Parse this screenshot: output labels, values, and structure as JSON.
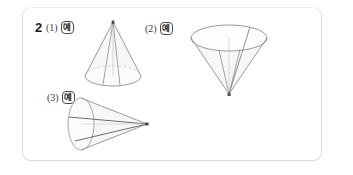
{
  "panel": {
    "background_color": "#ffffff",
    "border_color": "#dcdcdc",
    "corner_radius_px": 9
  },
  "question": {
    "number": "2",
    "items": [
      {
        "id": "1",
        "sub_label": "(1)",
        "answer_badge": "예",
        "figure": {
          "name": "cone-upright",
          "description": "원뿔 - 꼭짓점이 위",
          "orientation": "apex-up",
          "stroke_color": "#8a8a8a",
          "fill_color": "#f6f6f6"
        }
      },
      {
        "id": "2",
        "sub_label": "(2)",
        "answer_badge": "예",
        "figure": {
          "name": "cone-inverted",
          "description": "원뿔 - 꼭짓점이 아래",
          "orientation": "apex-down",
          "stroke_color": "#8a8a8a",
          "fill_color": "#f6f6f6"
        }
      },
      {
        "id": "3",
        "sub_label": "(3)",
        "answer_badge": "예",
        "figure": {
          "name": "cone-sideways",
          "description": "원뿔 - 꼭짓점이 오른쪽",
          "orientation": "apex-right",
          "stroke_color": "#8a8a8a",
          "fill_color": "#f6f6f6"
        }
      }
    ]
  }
}
